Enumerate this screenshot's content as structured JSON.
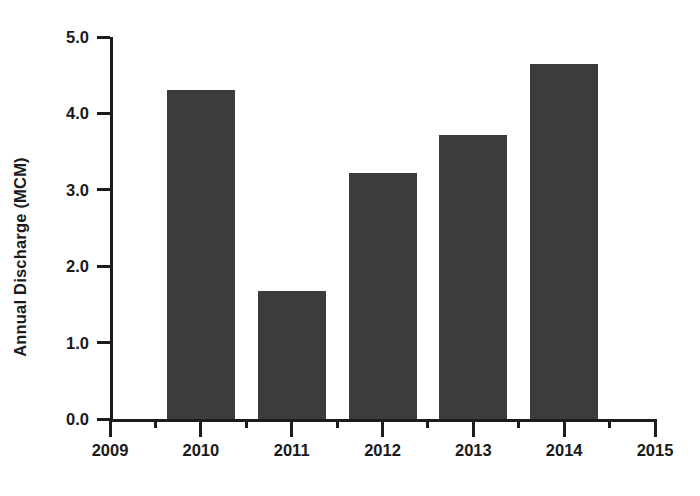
{
  "chart_data": {
    "type": "bar",
    "title": "",
    "subtitle": "",
    "xlabel": "",
    "ylabel": "Annual Discharge (MCM)",
    "categories": [
      "2010",
      "2011",
      "2012",
      "2013",
      "2014"
    ],
    "values": [
      4.3,
      1.68,
      3.22,
      3.72,
      4.65
    ],
    "series": [
      {
        "name": "Annual Discharge",
        "values": [
          4.3,
          1.68,
          3.22,
          3.72,
          4.65
        ]
      }
    ],
    "xlim": [
      2009,
      2015
    ],
    "ylim": [
      0.0,
      5.0
    ],
    "y_ticks": [
      0.0,
      1.0,
      2.0,
      3.0,
      4.0,
      5.0
    ],
    "y_tick_labels": [
      "0.0",
      "1.0",
      "2.0",
      "3.0",
      "4.0",
      "5.0"
    ],
    "x_ticks": [
      2009,
      2010,
      2011,
      2012,
      2013,
      2014,
      2015
    ],
    "x_tick_labels": [
      "2009",
      "2010",
      "2011",
      "2012",
      "2013",
      "2014",
      "2015"
    ],
    "x_minor_ticks": [
      2009.5,
      2010.5,
      2011.5,
      2012.5,
      2013.5,
      2014.5
    ],
    "grid": false,
    "legend": false,
    "legend_position": "none",
    "annotations": [],
    "bar_color": "#3c3c3c",
    "axis_color": "#1c1c1c",
    "text_color": "#1a1a1a",
    "background_color": "#ffffff"
  }
}
